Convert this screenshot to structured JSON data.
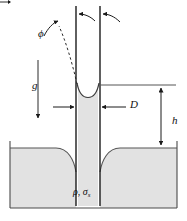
{
  "figure": {
    "type": "physics-diagram",
    "background_color": "#ffffff",
    "fluid_fill_color": "#e0e0e0",
    "line_color": "#2a2a2a",
    "labels": {
      "contact_angle": "ϕ",
      "gravity": "g",
      "diameter": "D",
      "height": "h",
      "fluid_properties_rho": "ρ",
      "fluid_properties_sep": ", ",
      "fluid_properties_sigma": "σ",
      "fluid_properties_sigma_sub": "s"
    },
    "annotations": {
      "contact_angle_description": "contact angle phi between meniscus tangent and tube wall",
      "gravity_description": "downward gravity vector g",
      "diameter_description": "tube inner diameter D indicated by inward arrows",
      "height_description": "capillary rise height h between reservoir level and meniscus",
      "fluid_description": "liquid density rho and surface tension sigma sub s"
    },
    "geometry": {
      "tube_left_wall_x": 76,
      "tube_right_wall_x": 100,
      "tube_top_y": 6,
      "reservoir_top_y": 146,
      "reservoir_bottom_y": 208,
      "meniscus_y": 84,
      "reservoir_left_x": 10,
      "reservoir_right_x": 177
    }
  }
}
